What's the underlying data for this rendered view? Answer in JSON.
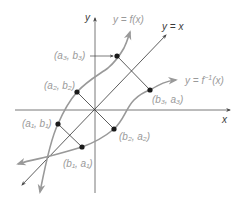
{
  "diagram": {
    "axes": {
      "x_label": "x",
      "y_label": "y"
    },
    "curves": {
      "f_label": "y = f(x)",
      "finv_label_prefix": "y = f",
      "finv_label_sup": "−1",
      "finv_label_suffix": "(x)",
      "identity_label": "y = x"
    },
    "points": [
      {
        "id": "a1b1",
        "label": "(a₁, b₁)"
      },
      {
        "id": "a2b2",
        "label": "(a₂, b₂)"
      },
      {
        "id": "a3b3",
        "label": "(a₃, b₃)"
      },
      {
        "id": "b1a1",
        "label": "(b₁, a₁)"
      },
      {
        "id": "b2a2",
        "label": "(b₂, a₂)"
      },
      {
        "id": "b3a3",
        "label": "(b₃, a₃)"
      }
    ],
    "colors": {
      "axis": "#555555",
      "curve": "#9a9a9a",
      "label": "#9a9a9a",
      "point": "#1a1a1a"
    }
  }
}
